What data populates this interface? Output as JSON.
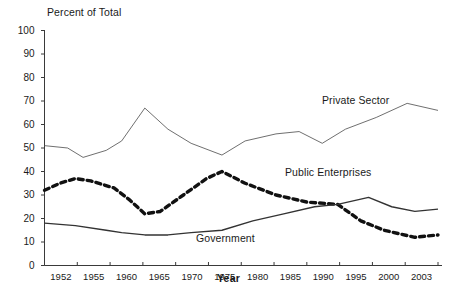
{
  "chart_data": {
    "type": "line",
    "title": "",
    "ylabel": "Percent of Total",
    "xlabel": "Year",
    "ylim": [
      0,
      100
    ],
    "ytick_step": 10,
    "grid": false,
    "legend_position": "inline-annotations",
    "categories": [
      "1952",
      "1955",
      "1960",
      "1965",
      "1970",
      "1975",
      "1980",
      "1985",
      "1990",
      "1995",
      "2000",
      "2003"
    ],
    "x": [
      1952,
      1953,
      1954,
      1955,
      1956,
      1957,
      1958,
      1959,
      1960,
      1961,
      1962,
      1963,
      1964,
      1965,
      1966,
      1967,
      1968,
      1969,
      1970,
      1971,
      1972,
      1973,
      1974,
      1975,
      1976,
      1977,
      1978,
      1979,
      1980,
      1981,
      1982,
      1983,
      1984,
      1985,
      1986,
      1987,
      1988,
      1989,
      1990,
      1991,
      1992,
      1993,
      1994,
      1995,
      1996,
      1997,
      1998,
      1999,
      2000,
      2001,
      2002,
      2003
    ],
    "ytick_labels": [
      "0",
      "10",
      "20",
      "30",
      "40",
      "50",
      "60",
      "70",
      "80",
      "90",
      "100"
    ],
    "series": [
      {
        "name": "Private Sector",
        "style": "thin-solid",
        "color": "#555555",
        "points": [
          {
            "year": 1952,
            "value": 51
          },
          {
            "year": 1955,
            "value": 50
          },
          {
            "year": 1957,
            "value": 46
          },
          {
            "year": 1960,
            "value": 49
          },
          {
            "year": 1962,
            "value": 53
          },
          {
            "year": 1965,
            "value": 67
          },
          {
            "year": 1968,
            "value": 58
          },
          {
            "year": 1971,
            "value": 52
          },
          {
            "year": 1975,
            "value": 47
          },
          {
            "year": 1978,
            "value": 53
          },
          {
            "year": 1982,
            "value": 56
          },
          {
            "year": 1985,
            "value": 57
          },
          {
            "year": 1988,
            "value": 52
          },
          {
            "year": 1991,
            "value": 58
          },
          {
            "year": 1995,
            "value": 63
          },
          {
            "year": 1999,
            "value": 69
          },
          {
            "year": 2003,
            "value": 66
          }
        ]
      },
      {
        "name": "Public Enterprises",
        "style": "thick-dashed",
        "color": "#111111",
        "points": [
          {
            "year": 1952,
            "value": 32
          },
          {
            "year": 1954,
            "value": 35
          },
          {
            "year": 1956,
            "value": 37
          },
          {
            "year": 1958,
            "value": 36
          },
          {
            "year": 1961,
            "value": 33
          },
          {
            "year": 1963,
            "value": 28
          },
          {
            "year": 1965,
            "value": 22
          },
          {
            "year": 1967,
            "value": 23
          },
          {
            "year": 1970,
            "value": 30
          },
          {
            "year": 1973,
            "value": 37
          },
          {
            "year": 1975,
            "value": 40
          },
          {
            "year": 1978,
            "value": 35
          },
          {
            "year": 1982,
            "value": 30
          },
          {
            "year": 1986,
            "value": 27
          },
          {
            "year": 1990,
            "value": 26
          },
          {
            "year": 1993,
            "value": 19
          },
          {
            "year": 1996,
            "value": 15
          },
          {
            "year": 2000,
            "value": 12
          },
          {
            "year": 2003,
            "value": 13
          }
        ]
      },
      {
        "name": "Government",
        "style": "medium-solid",
        "color": "#333333",
        "points": [
          {
            "year": 1952,
            "value": 18
          },
          {
            "year": 1956,
            "value": 17
          },
          {
            "year": 1960,
            "value": 15
          },
          {
            "year": 1962,
            "value": 14
          },
          {
            "year": 1965,
            "value": 13
          },
          {
            "year": 1968,
            "value": 13
          },
          {
            "year": 1971,
            "value": 14
          },
          {
            "year": 1975,
            "value": 15
          },
          {
            "year": 1979,
            "value": 19
          },
          {
            "year": 1983,
            "value": 22
          },
          {
            "year": 1987,
            "value": 25
          },
          {
            "year": 1990,
            "value": 26
          },
          {
            "year": 1994,
            "value": 29
          },
          {
            "year": 1997,
            "value": 25
          },
          {
            "year": 2000,
            "value": 23
          },
          {
            "year": 2003,
            "value": 24
          }
        ]
      }
    ],
    "annotations": [
      {
        "text": "Private Sector",
        "x_px": 322,
        "y_px": 94
      },
      {
        "text": "Public Enterprises",
        "x_px": 285,
        "y_px": 166
      },
      {
        "text": "Government",
        "x_px": 196,
        "y_px": 232
      }
    ]
  }
}
